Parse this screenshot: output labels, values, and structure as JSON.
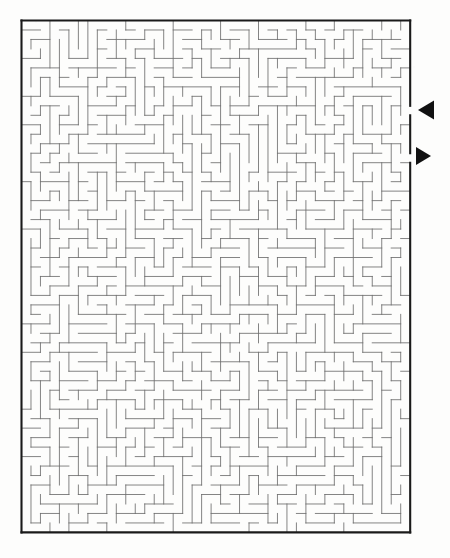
{
  "page": {
    "background_color": "#fdfdfc",
    "width": 450,
    "height": 558
  },
  "maze": {
    "kind": "rectangular-perfect-maze",
    "columns": 41,
    "rows": 54,
    "cell_size": 9.48,
    "origin_x": 21.5,
    "origin_y": 20.5,
    "border_color": "#1a1a1a",
    "border_width": 2.1,
    "wall_color": "#6e6e6e",
    "wall_width": 0.85,
    "seed": 20240917,
    "entrance": {
      "label": "entrance",
      "side": "right",
      "row": 9,
      "arrow": "left-pointing-triangle"
    },
    "exit": {
      "label": "exit",
      "side": "right",
      "row": 14,
      "arrow": "right-pointing-triangle"
    }
  },
  "markers": [
    {
      "name": "entrance-arrow",
      "direction": "left",
      "color": "#111111",
      "x": 418,
      "y": 110,
      "width": 16,
      "height": 19
    },
    {
      "name": "exit-arrow",
      "direction": "right",
      "color": "#111111",
      "x": 416,
      "y": 156,
      "width": 15,
      "height": 18
    }
  ]
}
